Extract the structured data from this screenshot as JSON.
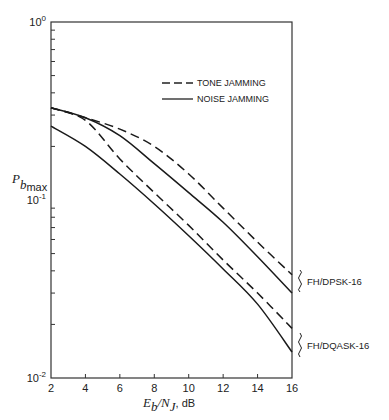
{
  "chart_data": {
    "type": "line",
    "title": "",
    "xlabel": "E_b/N_J, dB",
    "xlabel_parts": {
      "main1": "E",
      "sub1": "b",
      "slash": "/",
      "main2": "N",
      "sub2": "J",
      "unit": ", dB"
    },
    "ylabel": "P_bmax",
    "ylabel_parts": {
      "main": "P",
      "sub": "b",
      "subsub": "max"
    },
    "xlim": [
      2,
      16
    ],
    "ylim": [
      0.01,
      1
    ],
    "yscale": "log",
    "grid": false,
    "x": [
      2,
      4,
      6,
      8,
      10,
      12,
      14,
      16
    ],
    "x_ticks": [
      "2",
      "4",
      "6",
      "8",
      "10",
      "12",
      "14",
      "16"
    ],
    "y_ticks": [
      {
        "value": 1,
        "base": "10",
        "exp": "0"
      },
      {
        "value": 0.1,
        "base": "10",
        "exp": "-1"
      },
      {
        "value": 0.01,
        "base": "10",
        "exp": "-2"
      }
    ],
    "legend": {
      "placement": "top-right",
      "entries": [
        {
          "label": "TONE JAMMING",
          "style": "dashed"
        },
        {
          "label": "NOISE JAMMING",
          "style": "solid"
        }
      ]
    },
    "series": [
      {
        "name": "FH/DPSK-16 tone jamming",
        "group": "FH/DPSK-16",
        "style": "dashed",
        "values": [
          0.33,
          0.29,
          0.25,
          0.2,
          0.14,
          0.09,
          0.058,
          0.038
        ]
      },
      {
        "name": "FH/DPSK-16 noise jamming",
        "group": "FH/DPSK-16",
        "style": "solid",
        "values": [
          0.33,
          0.29,
          0.23,
          0.16,
          0.11,
          0.075,
          0.048,
          0.03
        ]
      },
      {
        "name": "FH/DQASK-16 tone jamming",
        "group": "FH/DQASK-16",
        "style": "dashed",
        "values": [
          0.33,
          0.28,
          0.17,
          0.11,
          0.072,
          0.046,
          0.03,
          0.019
        ]
      },
      {
        "name": "FH/DQASK-16 noise jamming",
        "group": "FH/DQASK-16",
        "style": "solid",
        "values": [
          0.26,
          0.2,
          0.14,
          0.095,
          0.063,
          0.041,
          0.026,
          0.014
        ]
      }
    ],
    "annotations": [
      {
        "text": "FH/DPSK-16",
        "series": [
          0,
          1
        ]
      },
      {
        "text": "FH/DQASK-16",
        "series": [
          2,
          3
        ]
      }
    ]
  }
}
